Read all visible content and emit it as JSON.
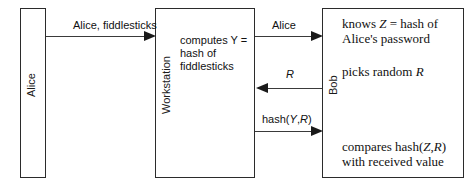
{
  "diagram": {
    "type": "authentication-protocol-sequence",
    "actors": {
      "alice": {
        "label": "Alice"
      },
      "workstation": {
        "label": "Workstation",
        "body": "computes Y =\nhash of\nfiddlesticks",
        "body_plain": "computes Y = hash of fiddlesticks"
      },
      "bob": {
        "label": "Bob",
        "knows": "knows Z = hash of Alice's password",
        "knows_line1_prefix": "knows ",
        "knows_var": "Z",
        "knows_line1_suffix": " = hash of",
        "knows_line2": "Alice's password",
        "picks_prefix": "picks random ",
        "picks_var": "R",
        "compares_prefix": "compares hash(",
        "compares_var1": "Z",
        "compares_comma": ",",
        "compares_var2": "R",
        "compares_suffix": ")",
        "compares_line2": "with received value"
      }
    },
    "messages": [
      {
        "id": "msg-alice-credentials",
        "label": "Alice, fiddlesticks",
        "from": "Alice",
        "to": "Workstation",
        "direction": "right"
      },
      {
        "id": "msg-identity",
        "label": "Alice",
        "from": "Workstation",
        "to": "Bob",
        "direction": "right"
      },
      {
        "id": "msg-challenge",
        "label": "R",
        "from": "Bob",
        "to": "Workstation",
        "direction": "left"
      },
      {
        "id": "msg-response",
        "label": "hash(Y,R)",
        "label_prefix": "hash(",
        "label_var1": "Y",
        "label_comma": ",",
        "label_var2": "R",
        "label_suffix": ")",
        "from": "Workstation",
        "to": "Bob",
        "direction": "right"
      }
    ],
    "colors": {
      "stroke": "#2b2b2b",
      "text": "#111111",
      "background": "#ffffff"
    }
  }
}
